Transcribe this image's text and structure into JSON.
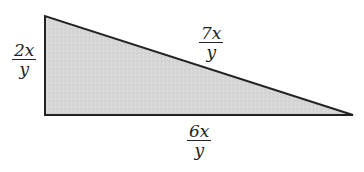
{
  "diagram": {
    "type": "right-triangle",
    "fill_color": "#d9d9d9",
    "stroke_color": "#222222",
    "vertices": {
      "top_left": [
        45,
        16
      ],
      "bottom_left": [
        45,
        115
      ],
      "right": [
        353,
        115
      ]
    },
    "labels": {
      "left_side": {
        "numerator": "2x",
        "denominator": "y"
      },
      "hypotenuse": {
        "numerator": "7x",
        "denominator": "y"
      },
      "bottom_side": {
        "numerator": "6x",
        "denominator": "y"
      }
    }
  }
}
